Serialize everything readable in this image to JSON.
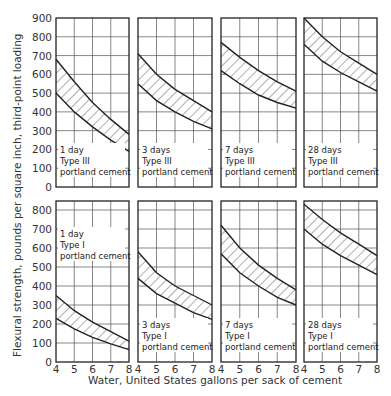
{
  "figure": {
    "ylabel": "Flexural strength, pounds per square inch, third-point loading",
    "xlabel": "Water, United States gallons per sack of cement"
  },
  "chart_data": [
    {
      "type": "area",
      "row": 0,
      "col": 0,
      "title": "1 day",
      "label_lines": [
        "1 day",
        "Type III",
        "portland cement"
      ],
      "label_pos": "bottom",
      "x": [
        4,
        5,
        6,
        7,
        8
      ],
      "upper": [
        680,
        560,
        450,
        360,
        280
      ],
      "lower": [
        500,
        400,
        320,
        250,
        190
      ],
      "xlim": [
        4,
        8
      ],
      "ylim": [
        0,
        900
      ],
      "yticks": [
        0,
        100,
        200,
        300,
        400,
        500,
        600,
        700,
        800,
        900
      ],
      "xticks": [],
      "grid": true
    },
    {
      "type": "area",
      "row": 0,
      "col": 1,
      "title": "3 days",
      "label_lines": [
        "3 days",
        "Type III",
        "portland cement"
      ],
      "label_pos": "bottom",
      "x": [
        4,
        5,
        6,
        7,
        8
      ],
      "upper": [
        710,
        600,
        520,
        460,
        400
      ],
      "lower": [
        550,
        460,
        400,
        350,
        310
      ],
      "xlim": [
        4,
        8
      ],
      "ylim": [
        0,
        900
      ],
      "grid": true
    },
    {
      "type": "area",
      "row": 0,
      "col": 2,
      "title": "7 days",
      "label_lines": [
        "7 days",
        "Type III",
        "portland cement"
      ],
      "label_pos": "bottom",
      "x": [
        4,
        5,
        6,
        7,
        8
      ],
      "upper": [
        770,
        690,
        620,
        560,
        510
      ],
      "lower": [
        620,
        550,
        490,
        450,
        420
      ],
      "xlim": [
        4,
        8
      ],
      "ylim": [
        0,
        900
      ],
      "grid": true
    },
    {
      "type": "area",
      "row": 0,
      "col": 3,
      "title": "28 days",
      "label_lines": [
        "28 days",
        "Type III",
        "portland cement"
      ],
      "label_pos": "bottom",
      "x": [
        4,
        5,
        6,
        7,
        8
      ],
      "upper": [
        900,
        800,
        720,
        660,
        600
      ],
      "lower": [
        760,
        670,
        610,
        560,
        510
      ],
      "xlim": [
        4,
        8
      ],
      "ylim": [
        0,
        900
      ],
      "grid": true
    },
    {
      "type": "area",
      "row": 1,
      "col": 0,
      "title": "1 day",
      "label_lines": [
        "1 day",
        "Type I",
        "portland cement"
      ],
      "label_pos": "top",
      "x": [
        4,
        5,
        6,
        7,
        8
      ],
      "upper": [
        350,
        270,
        210,
        160,
        110
      ],
      "lower": [
        230,
        175,
        130,
        95,
        65
      ],
      "xlim": [
        4,
        8
      ],
      "ylim": [
        0,
        800
      ],
      "yticks": [
        0,
        100,
        200,
        300,
        400,
        500,
        600,
        700,
        800
      ],
      "xticks": [
        4,
        5,
        6,
        7,
        8
      ],
      "grid": true
    },
    {
      "type": "area",
      "row": 1,
      "col": 1,
      "title": "3 days",
      "label_lines": [
        "3 days",
        "Type I",
        "portland cement"
      ],
      "label_pos": "bottom",
      "x": [
        4,
        5,
        6,
        7,
        8
      ],
      "upper": [
        580,
        470,
        400,
        350,
        300
      ],
      "lower": [
        440,
        360,
        310,
        260,
        225
      ],
      "xlim": [
        4,
        8
      ],
      "ylim": [
        0,
        800
      ],
      "xticks": [
        4,
        5,
        6,
        7,
        8
      ],
      "grid": true
    },
    {
      "type": "area",
      "row": 1,
      "col": 2,
      "title": "7 days",
      "label_lines": [
        "7 days",
        "Type I",
        "portland cement"
      ],
      "label_pos": "bottom",
      "x": [
        4,
        5,
        6,
        7,
        8
      ],
      "upper": [
        720,
        600,
        510,
        440,
        380
      ],
      "lower": [
        570,
        470,
        400,
        340,
        300
      ],
      "xlim": [
        4,
        8
      ],
      "ylim": [
        0,
        800
      ],
      "xticks": [
        4,
        5,
        6,
        7,
        8
      ],
      "grid": true
    },
    {
      "type": "area",
      "row": 1,
      "col": 3,
      "title": "28 days",
      "label_lines": [
        "28 days",
        "Type I",
        "portland cement"
      ],
      "label_pos": "bottom",
      "x": [
        4,
        5,
        6,
        7,
        8
      ],
      "upper": [
        830,
        750,
        680,
        620,
        560
      ],
      "lower": [
        700,
        620,
        560,
        510,
        460
      ],
      "xlim": [
        4,
        8
      ],
      "ylim": [
        0,
        800
      ],
      "xticks": [
        4,
        5,
        6,
        7,
        8
      ],
      "grid": true
    }
  ],
  "layout": {
    "cols_x": [
      [
        56,
        129
      ],
      [
        138,
        212
      ],
      [
        221,
        296
      ],
      [
        304,
        377
      ]
    ],
    "rows": [
      {
        "top": 18,
        "bottom": 187,
        "ymax": 900
      },
      {
        "top": 201,
        "bottom": 362,
        "ymax": 800,
        "ytop": 828
      }
    ],
    "line_color": "#222222",
    "grid_color": "#555555"
  }
}
